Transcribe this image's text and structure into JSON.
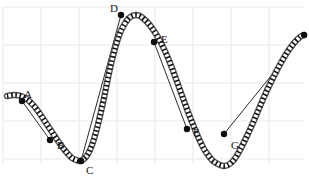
{
  "figure": {
    "title": "",
    "width": 309,
    "height": 191,
    "background_color": "#ffffff",
    "grid": {
      "visible": true,
      "color": "#f0f0f2",
      "cell_width": 38,
      "cell_height": 38,
      "x_start": 3,
      "y_start": 7,
      "x_end": 305,
      "y_end": 163,
      "line_width": 1.6
    }
  },
  "chart_data": {
    "type": "line",
    "title": "",
    "xlabel": "",
    "ylabel": "",
    "xlim": [
      0,
      309
    ],
    "ylim": [
      191,
      0
    ],
    "grid": true,
    "legend": "none",
    "curve": {
      "name": "main-curve",
      "style": "dotted-thick",
      "color": "#111111",
      "stroke_width": 5,
      "dash_pattern": "1.6 2.6",
      "halo_color": "#5a5a5a",
      "halo_width": 6.4,
      "x": [
        7,
        14,
        21,
        28,
        34,
        40,
        46,
        52,
        58,
        63,
        68,
        72,
        76,
        80,
        84,
        88,
        92,
        96,
        100,
        104,
        108,
        112,
        116,
        120,
        124,
        128,
        132,
        136,
        140,
        144,
        148,
        152,
        156,
        160,
        164,
        168,
        172,
        176,
        180,
        184,
        188,
        192,
        196,
        200,
        204,
        208,
        212,
        216,
        220,
        224,
        228,
        232,
        236,
        240,
        246,
        252,
        258,
        264,
        270,
        276,
        282,
        288,
        294,
        300,
        304
      ],
      "y": [
        96,
        95,
        96,
        100,
        106,
        114,
        123,
        132,
        141,
        148,
        154,
        158,
        160,
        161,
        159,
        154,
        145,
        132,
        116,
        98,
        78,
        60,
        45,
        33,
        25,
        19,
        16,
        15,
        16,
        19,
        23,
        28,
        34,
        41,
        49,
        58,
        68,
        79,
        90,
        101,
        112,
        122,
        132,
        141,
        149,
        155,
        160,
        163,
        165,
        166,
        165,
        162,
        157,
        150,
        138,
        125,
        111,
        97,
        84,
        72,
        61,
        51,
        43,
        37,
        35
      ]
    },
    "points": [
      {
        "label": "A",
        "x": 22,
        "y": 101,
        "label_x": 24,
        "label_y": 89
      },
      {
        "label": "B",
        "x": 50,
        "y": 140,
        "label_x": 57,
        "label_y": 140
      },
      {
        "label": "C",
        "x": 81,
        "y": 161,
        "label_x": 86,
        "label_y": 165
      },
      {
        "label": "D",
        "x": 121,
        "y": 15,
        "label_x": 110,
        "label_y": 3
      },
      {
        "label": "E",
        "x": 154,
        "y": 42,
        "label_x": 161,
        "label_y": 34
      },
      {
        "label": "F",
        "x": 187,
        "y": 129,
        "label_x": 193,
        "label_y": 127
      },
      {
        "label": "G",
        "x": 224,
        "y": 134,
        "label_x": 231,
        "label_y": 140
      },
      {
        "label": "",
        "x": 304,
        "y": 35,
        "label_x": 0,
        "label_y": 0
      }
    ],
    "chords": [
      {
        "name": "chord-A-B",
        "from": "A",
        "to": "B",
        "x1": 22,
        "y1": 101,
        "x2": 50,
        "y2": 140
      },
      {
        "name": "chord-D-C",
        "from": "D",
        "to": "C",
        "x1": 121,
        "y1": 15,
        "x2": 81,
        "y2": 161
      },
      {
        "name": "chord-E-F",
        "from": "E",
        "to": "F",
        "x1": 154,
        "y1": 42,
        "x2": 187,
        "y2": 129
      },
      {
        "name": "chord-G-end",
        "from": "G",
        "to": "end",
        "x1": 224,
        "y1": 134,
        "x2": 304,
        "y2": 35
      }
    ],
    "chord_style": {
      "color": "#2b2b2b",
      "stroke_width": 1
    },
    "marker_style": {
      "shape": "circle",
      "radius": 3.2,
      "color": "#0d0d0d"
    }
  }
}
